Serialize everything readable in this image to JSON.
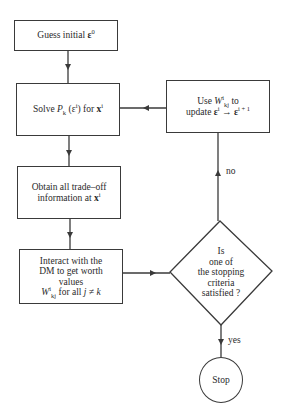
{
  "nodes": {
    "guess": {
      "type": "process",
      "lines": [
        "Guess initial ε⁰"
      ],
      "parts": {
        "text": "Guess initial ",
        "symbol": "ε",
        "sup": "0"
      }
    },
    "solve": {
      "type": "process",
      "lines": [
        "Solve Pk(εⁱ) for xⁱ"
      ],
      "parts": {
        "text1": "Solve ",
        "P": "P",
        "P_sub": "k",
        "paren_open": "(",
        "eps": "ε",
        "eps_sup": "i",
        "paren_close": ")",
        "text2": " for ",
        "x": "x",
        "x_sup": "i"
      }
    },
    "update": {
      "type": "process",
      "lines": [
        "Use Wⁱkj to",
        "update εⁱ → εⁱ⁺¹"
      ],
      "parts": {
        "use": "Use ",
        "W": "W",
        "W_sup": "i",
        "W_sub": "kj",
        "to": " to",
        "update": "update ",
        "eps": "ε",
        "eps_sup": "i",
        "arrow": " → ",
        "eps2": "ε",
        "eps2_sup": "i + 1"
      }
    },
    "obtain": {
      "type": "process",
      "lines": [
        "Obtain all trade-off",
        "information at xⁱ"
      ],
      "parts": {
        "line1": "Obtain all trade–off",
        "line2": "information at ",
        "x": "x",
        "x_sup": "i"
      }
    },
    "interact": {
      "type": "process",
      "lines": [
        "Interact with the",
        "DM to get worth",
        "values",
        "Wⁱkj for all j ≠ k"
      ],
      "parts": {
        "line1": "Interact with the",
        "line2": "DM to get worth",
        "line3": "values",
        "W": "W",
        "W_sup": "i",
        "W_sub": "kj",
        "line4_rest": " for all ",
        "j": "j",
        "neq": " ≠ ",
        "k": "k"
      }
    },
    "decision": {
      "type": "decision",
      "lines": [
        "Is",
        "one of",
        "the stopping",
        "criteria",
        "satisfied ?"
      ]
    },
    "stop": {
      "type": "terminal",
      "label": "Stop"
    }
  },
  "edges": [
    {
      "from": "guess",
      "to": "solve",
      "label": ""
    },
    {
      "from": "solve",
      "to": "obtain",
      "label": ""
    },
    {
      "from": "obtain",
      "to": "interact",
      "label": ""
    },
    {
      "from": "interact",
      "to": "decision",
      "label": ""
    },
    {
      "from": "decision",
      "to": "update",
      "label": "no"
    },
    {
      "from": "update",
      "to": "solve",
      "label": ""
    },
    {
      "from": "decision",
      "to": "stop",
      "label": "yes"
    }
  ],
  "edge_labels": {
    "no": "no",
    "yes": "yes"
  },
  "colors": {
    "stroke": "#3a3a3a",
    "text": "#2a2a2a",
    "background": "#ffffff"
  }
}
